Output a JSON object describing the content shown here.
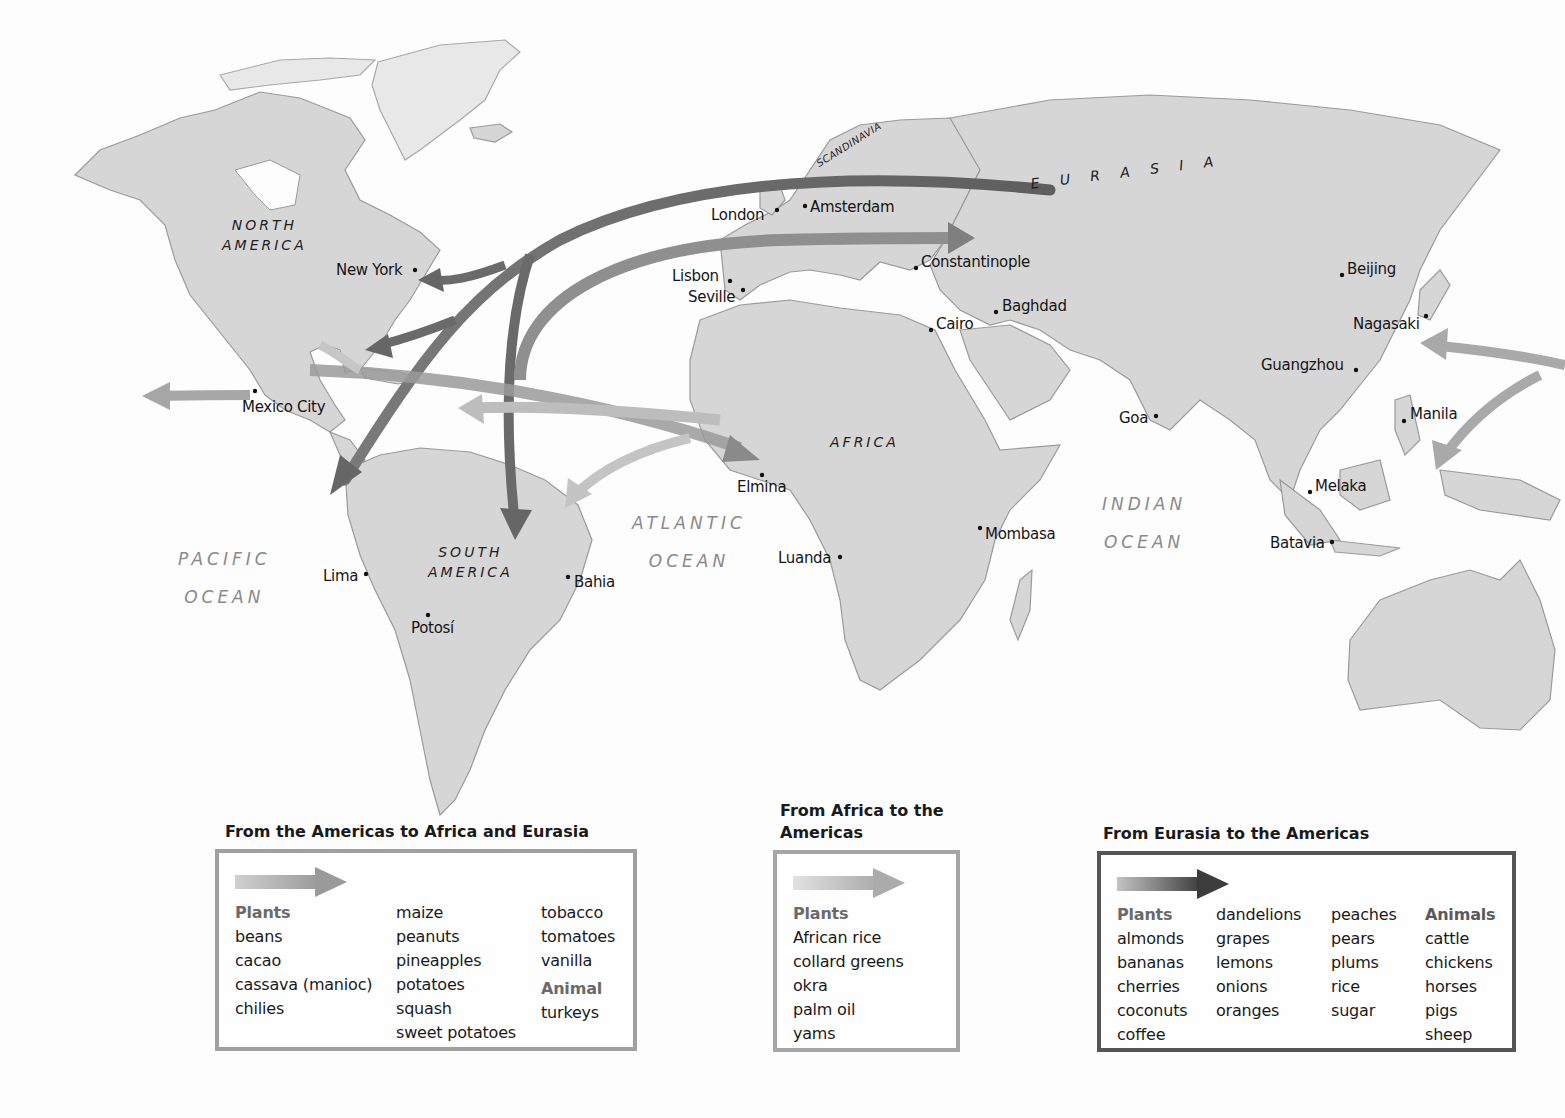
{
  "map": {
    "regions": {
      "north_america": [
        "NORTH",
        "AMERICA"
      ],
      "south_america": [
        "SOUTH",
        "AMERICA"
      ],
      "africa": "AFRICA",
      "eurasia": "E  U  R  A  S  I  A",
      "scandinavia": "SCANDINAVIA"
    },
    "oceans": {
      "pacific": [
        "PACIFIC",
        "OCEAN"
      ],
      "atlantic": [
        "ATLANTIC",
        "OCEAN"
      ],
      "indian": [
        "INDIAN",
        "OCEAN"
      ]
    },
    "cities": [
      {
        "name": "London",
        "x": 777,
        "y": 210
      },
      {
        "name": "Amsterdam",
        "x": 805,
        "y": 206
      },
      {
        "name": "New York",
        "x": 415,
        "y": 270
      },
      {
        "name": "Lisbon",
        "x": 730,
        "y": 281
      },
      {
        "name": "Seville",
        "x": 743,
        "y": 290
      },
      {
        "name": "Constantinople",
        "x": 916,
        "y": 268
      },
      {
        "name": "Baghdad",
        "x": 996,
        "y": 312
      },
      {
        "name": "Cairo",
        "x": 931,
        "y": 330
      },
      {
        "name": "Beijing",
        "x": 1342,
        "y": 275
      },
      {
        "name": "Nagasaki",
        "x": 1426,
        "y": 316
      },
      {
        "name": "Guangzhou",
        "x": 1356,
        "y": 370
      },
      {
        "name": "Mexico City",
        "x": 255,
        "y": 391
      },
      {
        "name": "Goa",
        "x": 1156,
        "y": 416
      },
      {
        "name": "Manila",
        "x": 1404,
        "y": 421
      },
      {
        "name": "Elmina",
        "x": 762,
        "y": 475
      },
      {
        "name": "Melaka",
        "x": 1310,
        "y": 492
      },
      {
        "name": "Mombasa",
        "x": 980,
        "y": 528
      },
      {
        "name": "Batavia",
        "x": 1332,
        "y": 542
      },
      {
        "name": "Luanda",
        "x": 840,
        "y": 557
      },
      {
        "name": "Lima",
        "x": 366,
        "y": 574
      },
      {
        "name": "Bahia",
        "x": 568,
        "y": 577
      },
      {
        "name": "Potosí",
        "x": 428,
        "y": 615
      }
    ]
  },
  "legend": {
    "americas": {
      "title": "From the Americas to Africa and Eurasia",
      "arrow_color": "#a9a9a9",
      "columns": [
        {
          "head": "Plants",
          "items": [
            "beans",
            "cacao",
            "cassava (manioc)",
            "chilies"
          ]
        },
        {
          "items": [
            "maize",
            "peanuts",
            "pineapples",
            "potatoes",
            "squash",
            "sweet potatoes"
          ]
        },
        {
          "items": [
            "tobacco",
            "tomatoes",
            "vanilla"
          ],
          "subhead": "Animal",
          "subitems": [
            "turkeys"
          ]
        }
      ]
    },
    "africa": {
      "title_line1": "From Africa to the",
      "title_line2": "Americas",
      "arrow_color": "#bdbdbd",
      "columns": [
        {
          "head": "Plants",
          "items": [
            "African rice",
            "collard greens",
            "okra",
            "palm oil",
            "yams"
          ]
        }
      ]
    },
    "eurasia": {
      "title": "From Eurasia to the Americas",
      "arrow_color": "#6e6e6e",
      "columns": [
        {
          "head": "Plants",
          "items": [
            "almonds",
            "bananas",
            "cherries",
            "coconuts",
            "coffee"
          ]
        },
        {
          "items": [
            "dandelions",
            "grapes",
            "lemons",
            "onions",
            "oranges"
          ]
        },
        {
          "items": [
            "peaches",
            "pears",
            "plums",
            "rice",
            "sugar"
          ]
        },
        {
          "head": "Animals",
          "items": [
            "cattle",
            "chickens",
            "horses",
            "pigs",
            "sheep"
          ]
        }
      ]
    }
  }
}
